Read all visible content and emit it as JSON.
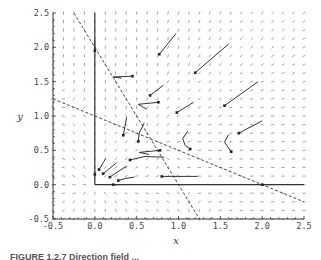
{
  "chart_data": {
    "type": "direction-field",
    "title": "",
    "xlabel": "x",
    "ylabel": "y",
    "xlim": [
      -0.5,
      2.5
    ],
    "ylim": [
      -0.5,
      2.5
    ],
    "x_ticks": [
      "-0.5",
      "0.0",
      "0.5",
      "1.0",
      "1.5",
      "2.0",
      "2.5"
    ],
    "y_ticks": [
      "-0.5",
      "0.0",
      "0.5",
      "1.0",
      "1.5",
      "2.0",
      "2.5"
    ],
    "grid": false,
    "field": {
      "description": "Direction field of a competing-species system",
      "dx": "x(2 - 2x - y)",
      "dy": "y(2 - x - 2y)",
      "coef": {
        "x": [
          2,
          2,
          1
        ],
        "y": [
          2,
          1,
          2
        ]
      },
      "spacing": 0.125
    },
    "nullclines": [
      {
        "name": "x-axis-invariant",
        "style": "solid",
        "points": [
          [
            0,
            0
          ],
          [
            2.5,
            0
          ]
        ]
      },
      {
        "name": "y-axis-invariant",
        "style": "solid",
        "points": [
          [
            0,
            0
          ],
          [
            0,
            2.5
          ]
        ]
      },
      {
        "name": "x-nullcline",
        "equation": "y = 2 - 2x",
        "style": "dashed",
        "points": [
          [
            -0.25,
            2.5
          ],
          [
            1.25,
            -0.5
          ]
        ]
      },
      {
        "name": "y-nullcline",
        "equation": "y = 1 - x/2",
        "style": "dashed",
        "points": [
          [
            -0.5,
            1.25
          ],
          [
            2.5,
            -0.25
          ]
        ]
      }
    ],
    "trajectories": [
      {
        "points": [
          [
            0.97,
            2.2
          ],
          [
            0.77,
            1.9
          ]
        ]
      },
      {
        "points": [
          [
            1.6,
            2.05
          ],
          [
            1.2,
            1.63
          ]
        ]
      },
      {
        "points": [
          [
            1.95,
            1.5
          ],
          [
            1.55,
            1.15
          ]
        ]
      },
      {
        "points": [
          [
            1.18,
            1.2
          ],
          [
            0.98,
            1.05
          ]
        ]
      },
      {
        "points": [
          [
            0.82,
            1.45
          ],
          [
            0.66,
            1.3
          ]
        ]
      },
      {
        "points": [
          [
            2.0,
            0.93
          ],
          [
            1.72,
            0.75
          ]
        ]
      },
      {
        "points": [
          [
            0.32,
            1.55
          ],
          [
            0.22,
            1.57
          ],
          [
            0.45,
            1.58
          ]
        ]
      },
      {
        "points": [
          [
            0.62,
            1.1
          ],
          [
            0.52,
            1.17
          ],
          [
            0.76,
            1.2
          ]
        ]
      },
      {
        "points": [
          [
            0.65,
            0.44
          ],
          [
            0.53,
            0.47
          ],
          [
            0.78,
            0.5
          ]
        ]
      },
      {
        "points": [
          [
            1.11,
            0.78
          ],
          [
            1.05,
            0.67
          ],
          [
            1.08,
            0.57
          ],
          [
            1.14,
            0.52
          ]
        ]
      },
      {
        "points": [
          [
            1.6,
            0.73
          ],
          [
            1.55,
            0.62
          ],
          [
            1.59,
            0.55
          ],
          [
            1.63,
            0.48
          ]
        ]
      },
      {
        "points": [
          [
            0.38,
            0.98
          ],
          [
            0.34,
            0.72
          ]
        ]
      },
      {
        "points": [
          [
            0.59,
            0.9
          ],
          [
            0.53,
            0.75
          ],
          [
            0.52,
            0.63
          ]
        ]
      },
      {
        "points": [
          [
            0.13,
            0.38
          ],
          [
            0.1,
            0.32
          ],
          [
            0.05,
            0.22
          ]
        ]
      },
      {
        "points": [
          [
            0.26,
            0.32
          ],
          [
            0.16,
            0.22
          ],
          [
            0.1,
            0.16
          ]
        ]
      },
      {
        "points": [
          [
            0.38,
            0.27
          ],
          [
            0.25,
            0.17
          ],
          [
            0.18,
            0.11
          ]
        ]
      },
      {
        "points": [
          [
            0.47,
            0.11
          ],
          [
            0.36,
            0.09
          ],
          [
            0.28,
            0.06
          ]
        ]
      },
      {
        "points": [
          [
            1.23,
            0.12
          ],
          [
            0.8,
            0.12
          ]
        ]
      },
      {
        "points": [
          [
            0.83,
            0.4
          ],
          [
            0.6,
            0.41
          ],
          [
            0.42,
            0.36
          ]
        ]
      },
      {
        "points": [
          [
            0.0,
            2.1
          ],
          [
            0.0,
            1.95
          ]
        ]
      },
      {
        "points": [
          [
            0.0,
            0.2
          ],
          [
            0.0,
            0.15
          ]
        ]
      },
      {
        "points": [
          [
            0.3,
            0.0
          ],
          [
            0.22,
            0.0
          ]
        ]
      },
      {
        "points": [
          [
            2.1,
            0.0
          ],
          [
            2.0,
            0.0
          ]
        ]
      }
    ],
    "equilibria": [
      [
        0,
        0
      ],
      [
        0,
        1
      ],
      [
        1,
        0
      ],
      [
        0.6667,
        0.6667
      ]
    ]
  },
  "caption": {
    "text": "FIGURE 1.2.7  Direction field ..."
  }
}
